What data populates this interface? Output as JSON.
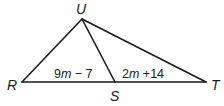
{
  "diagram": {
    "type": "triangle",
    "stroke_color": "#1a1a1a",
    "vertices": [
      {
        "name": "U",
        "x": 82,
        "y": 19,
        "label_x": 80,
        "label_y": 14
      },
      {
        "name": "R",
        "x": 22,
        "y": 82,
        "label_x": 7,
        "label_y": 90
      },
      {
        "name": "S",
        "x": 115,
        "y": 82,
        "label_x": 111,
        "label_y": 101
      },
      {
        "name": "T",
        "x": 206,
        "y": 82,
        "label_x": 213,
        "label_y": 90
      }
    ],
    "segments": [
      "UR",
      "UT",
      "US",
      "RT"
    ],
    "segment_labels": {
      "RS": {
        "coef": "9",
        "var": "m",
        "rest": " − 7"
      },
      "ST": {
        "coef": "2",
        "var": "m",
        "rest": " +14"
      }
    }
  }
}
